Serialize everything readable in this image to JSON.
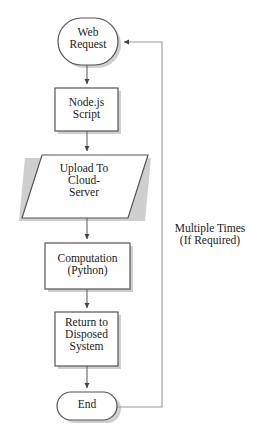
{
  "diagram": {
    "background_color": "#ffffff",
    "stroke_color": "#555555",
    "text_color": "#1a1a1a",
    "shadow_color": "#cccccc",
    "nodes": [
      {
        "id": "web-request",
        "shape": "terminator",
        "label": "Web\nRequest",
        "lines": [
          "Web",
          "Request"
        ]
      },
      {
        "id": "nodejs-script",
        "shape": "process",
        "label": "Node.js\nScript",
        "lines": [
          "Node.js",
          "Script"
        ]
      },
      {
        "id": "upload-cloud-server",
        "shape": "data-parallelogram",
        "label": "Upload To\nCloud-\nServer",
        "lines": [
          "Upload To",
          "Cloud-",
          "Server"
        ]
      },
      {
        "id": "computation-python",
        "shape": "process",
        "label": "Computation\n(Python)",
        "lines": [
          "Computation",
          "(Python)"
        ]
      },
      {
        "id": "return-disposed-system",
        "shape": "process",
        "label": "Return to\nDisposed\nSystem",
        "lines": [
          "Return to",
          "Disposed",
          "System"
        ]
      },
      {
        "id": "end",
        "shape": "terminator",
        "label": "End",
        "lines": [
          "End"
        ]
      }
    ],
    "annotations": [
      {
        "id": "feedback-loop-label",
        "label": "Multiple Times\n(If Required)",
        "lines": [
          "Multiple Times",
          "(If Required)"
        ]
      }
    ],
    "edges": [
      {
        "id": "edge-web-request-to-nodejs",
        "from": "web-request",
        "to": "nodejs-script",
        "arrow": true
      },
      {
        "id": "edge-nodejs-to-upload",
        "from": "nodejs-script",
        "to": "upload-cloud-server",
        "arrow": true
      },
      {
        "id": "edge-upload-to-computation",
        "from": "upload-cloud-server",
        "to": "computation-python",
        "arrow": true
      },
      {
        "id": "edge-computation-to-return",
        "from": "computation-python",
        "to": "return-disposed-system",
        "arrow": true
      },
      {
        "id": "edge-return-to-end",
        "from": "return-disposed-system",
        "to": "end",
        "arrow": true
      },
      {
        "id": "edge-end-to-web-request-feedback",
        "from": "end",
        "to": "web-request",
        "arrow": true,
        "label": "Multiple Times (If Required)"
      }
    ]
  }
}
